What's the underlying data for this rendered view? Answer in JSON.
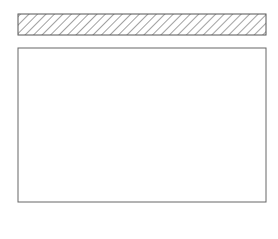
{
  "figure": {
    "cross_section": {
      "beads": [
        {
          "id": "a",
          "cx": 41,
          "w": 28,
          "h": 5
        },
        {
          "id": "b",
          "cx": 92,
          "w": 16,
          "h": 7
        },
        {
          "id": "c",
          "cx": 137,
          "w": 30,
          "h": 5
        },
        {
          "id": "d",
          "cx": 197,
          "w": 32,
          "h": 8
        },
        {
          "id": "e",
          "cx": 240,
          "w": 14,
          "h": 4
        }
      ]
    },
    "panels": [
      {
        "id": "a",
        "label": "(a)",
        "pattern": "arc-ripples",
        "cx": 40,
        "width": 28
      },
      {
        "id": "b",
        "label": "(b)",
        "pattern": "dense-arc-ripples",
        "cx": 89,
        "width": 22
      },
      {
        "id": "c",
        "label": "(c)",
        "pattern": "chevron-ripples-with-spatter",
        "cx": 137,
        "width": 36
      },
      {
        "id": "d",
        "label": "(d)",
        "pattern": "wide-arc-ripples",
        "cx": 197,
        "width": 34
      },
      {
        "id": "e",
        "label": "(e)",
        "pattern": "narrow-chevron-ripples",
        "cx": 240,
        "width": 18
      }
    ]
  },
  "colors": {
    "line": "#222222",
    "hatch": "#444444",
    "border": "#555555",
    "stipple": "#777777"
  }
}
